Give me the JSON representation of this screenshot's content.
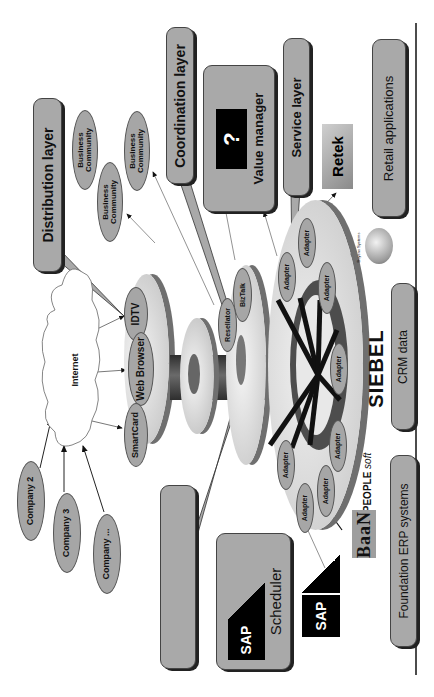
{
  "diagram": {
    "orientation": "rotated -90deg (text reads bottom-to-top)",
    "layers": {
      "distribution": "Distribution layer",
      "coordination": "Coordination layer",
      "value_manager": "Value manager",
      "service": "Service layer",
      "business_process": "Business process management",
      "bpm_line1": "Business process",
      "bpm_line2": "management"
    },
    "systems": {
      "retail": "Retail applications",
      "crm": "CRM data",
      "erp": "Foundation ERP systems"
    },
    "business_communities": [
      "Business Community",
      "Business Community",
      "Business Community"
    ],
    "bc_line1": "Business",
    "bc_line2": "Community",
    "internet": "Internet",
    "companies": [
      "Company 2",
      "Company 3",
      "Company ..."
    ],
    "channels": [
      "IDTV",
      "Web Browser",
      "SmartCard"
    ],
    "coordination_nodes": [
      "BizTalk",
      "Resellator"
    ],
    "adapters": [
      "Adapter",
      "Adapter",
      "Adapter",
      "Adapter",
      "Adapter",
      "Adapter",
      "Adapter",
      "Adapter"
    ],
    "logos": {
      "retek": "Retek",
      "siebel": "SIEBEL",
      "baan": "BaaN",
      "peoplesoft": "PEOPLE",
      "peoplesoft_sub": "soft",
      "sap": "SAP",
      "sap_scheduler_sap": "SAP",
      "sap_scheduler_label": "Scheduler",
      "sphere_caption": "Buyens Systems",
      "question_mark": "?"
    },
    "colors": {
      "box_fill": "#a9a9a9",
      "box_shadow": "#222222",
      "disk_light": "#e6e6e6",
      "disk_edge": "#6f6f6f",
      "spindle": "#4a4a4a",
      "rule_line": "#111111"
    }
  }
}
